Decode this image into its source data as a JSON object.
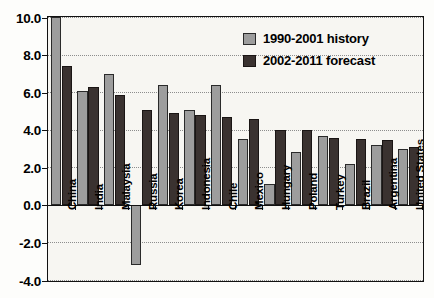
{
  "chart_data": {
    "type": "bar",
    "title": "",
    "subtitle": "",
    "xlabel": "",
    "ylabel": "",
    "ylim": [
      -4.0,
      10.0
    ],
    "ytick_step": 2.0,
    "ytick_labels": [
      "10.0",
      "8.0",
      "6.0",
      "4.0",
      "2.0",
      "0.0",
      "-2.0",
      "-4.0"
    ],
    "ytick_values": [
      10.0,
      8.0,
      6.0,
      4.0,
      2.0,
      0.0,
      -2.0,
      -4.0
    ],
    "grid": true,
    "grid_style": "dotted-horizontal",
    "legend_position": "top-right",
    "categories": [
      "China",
      "India",
      "Malaysia",
      "Russia",
      "Korea",
      "Indonesia",
      "Chile",
      "Mexico",
      "Hungary",
      "Poland",
      "Turkey",
      "Brazil",
      "Argentina",
      "United States"
    ],
    "series": [
      {
        "name": "1990-2001 history",
        "color": "#9d9d9d",
        "values": [
          10.0,
          6.05,
          6.95,
          -3.2,
          6.4,
          5.05,
          6.4,
          3.5,
          1.1,
          2.8,
          3.65,
          2.15,
          3.2,
          3.0
        ]
      },
      {
        "name": "2002-2011 forecast",
        "color": "#3a3230",
        "values": [
          7.4,
          6.3,
          5.85,
          5.05,
          4.9,
          4.8,
          4.7,
          4.55,
          4.0,
          4.0,
          3.55,
          3.5,
          3.45,
          3.1
        ]
      }
    ]
  },
  "legend": {
    "items": [
      {
        "label": "1990-2001 history",
        "swatch": "history-swatch"
      },
      {
        "label": "2002-2011 forecast",
        "swatch": "forecast-swatch"
      }
    ]
  },
  "colors": {
    "history": "#9d9d9d",
    "forecast": "#3a3230",
    "axis": "#111111",
    "grid": "#8d8d8d",
    "plot_background": "#f7f6f2"
  }
}
